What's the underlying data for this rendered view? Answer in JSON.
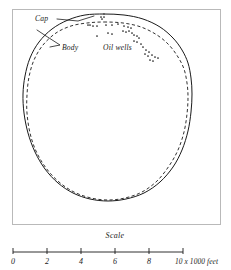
{
  "figure": {
    "title": "",
    "frame": {
      "x": 12,
      "y": 9,
      "width": 208,
      "height": 215
    },
    "annotations": {
      "cap_label": "Cap",
      "body_label": "Body",
      "wells_label": "Oil wells"
    },
    "legend_meaning": {
      "cap_line": "solid outer outline",
      "body_line": "dashed inner outline"
    },
    "colors": {
      "ink": "#1a1a1a",
      "frame": "#b9b9b9",
      "background": "#ffffff"
    }
  },
  "scale": {
    "title": "Scale",
    "unit_label": "10 x 1000 feet",
    "ticks": [
      "0",
      "2",
      "4",
      "6",
      "8",
      "10"
    ],
    "tick_values": [
      0,
      2,
      4,
      6,
      8,
      10
    ],
    "axis": {
      "x_start": 13,
      "x_end": 183,
      "y": 252
    }
  },
  "chart_data": {
    "type": "scatter",
    "title": "",
    "subtitle": "",
    "xlabel": "",
    "ylabel": "",
    "grid": false,
    "legend_position": "in-plot annotations",
    "units": "thousands of feet",
    "px_per_unit": 17,
    "series": [
      {
        "name": "Cap",
        "kind": "closed-outline",
        "style": "solid",
        "points_px": [
          [
            104,
            14
          ],
          [
            124,
            15
          ],
          [
            143,
            19
          ],
          [
            160,
            27
          ],
          [
            173,
            38
          ],
          [
            182,
            50
          ],
          [
            188,
            63
          ],
          [
            191,
            78
          ],
          [
            192,
            94
          ],
          [
            191,
            112
          ],
          [
            188,
            131
          ],
          [
            182,
            150
          ],
          [
            173,
            167
          ],
          [
            160,
            182
          ],
          [
            144,
            193
          ],
          [
            126,
            199
          ],
          [
            108,
            201
          ],
          [
            90,
            199
          ],
          [
            73,
            193
          ],
          [
            58,
            183
          ],
          [
            45,
            169
          ],
          [
            35,
            152
          ],
          [
            28,
            133
          ],
          [
            24,
            113
          ],
          [
            23,
            94
          ],
          [
            25,
            76
          ],
          [
            30,
            58
          ],
          [
            39,
            42
          ],
          [
            52,
            29
          ],
          [
            68,
            20
          ],
          [
            85,
            15
          ],
          [
            104,
            14
          ]
        ]
      },
      {
        "name": "Body",
        "kind": "closed-outline",
        "style": "dashed",
        "points_px": [
          [
            104,
            22
          ],
          [
            123,
            23
          ],
          [
            141,
            27
          ],
          [
            157,
            35
          ],
          [
            169,
            45
          ],
          [
            178,
            57
          ],
          [
            184,
            69
          ],
          [
            187,
            83
          ],
          [
            188,
            97
          ],
          [
            187,
            114
          ],
          [
            184,
            132
          ],
          [
            178,
            150
          ],
          [
            169,
            166
          ],
          [
            157,
            181
          ],
          [
            142,
            192
          ],
          [
            125,
            198
          ],
          [
            108,
            200
          ],
          [
            91,
            198
          ],
          [
            74,
            192
          ],
          [
            59,
            182
          ],
          [
            46,
            168
          ],
          [
            36,
            151
          ],
          [
            30,
            133
          ],
          [
            27,
            113
          ],
          [
            27,
            95
          ],
          [
            29,
            77
          ],
          [
            34,
            60
          ],
          [
            43,
            45
          ],
          [
            56,
            33
          ],
          [
            71,
            26
          ],
          [
            87,
            23
          ],
          [
            104,
            22
          ]
        ]
      },
      {
        "name": "Oil wells",
        "kind": "points",
        "style": "dots",
        "points_px": [
          [
            101,
            17
          ],
          [
            104,
            17
          ],
          [
            102,
            19
          ],
          [
            88,
            25
          ],
          [
            90,
            25
          ],
          [
            93,
            26
          ],
          [
            97,
            26
          ],
          [
            106,
            25
          ],
          [
            112,
            25
          ],
          [
            118,
            24
          ],
          [
            124,
            26
          ],
          [
            128,
            27
          ],
          [
            131,
            28
          ],
          [
            123,
            31
          ],
          [
            126,
            32
          ],
          [
            129,
            31
          ],
          [
            132,
            33
          ],
          [
            134,
            35
          ],
          [
            137,
            36
          ],
          [
            139,
            38
          ],
          [
            108,
            33
          ],
          [
            112,
            34
          ],
          [
            97,
            36
          ],
          [
            134,
            41
          ],
          [
            137,
            42
          ],
          [
            141,
            44
          ],
          [
            143,
            47
          ],
          [
            146,
            50
          ],
          [
            149,
            52
          ],
          [
            152,
            55
          ],
          [
            155,
            57
          ],
          [
            158,
            58
          ],
          [
            150,
            60
          ],
          [
            153,
            61
          ],
          [
            148,
            56
          ],
          [
            145,
            54
          ]
        ]
      }
    ]
  }
}
